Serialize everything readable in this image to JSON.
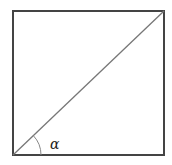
{
  "diagram": {
    "type": "square-with-diagonal",
    "angle_label": "α",
    "colors": {
      "square_stroke": "#444444",
      "diagonal_stroke": "#777777",
      "arc_stroke": "#888888",
      "background": "#ffffff"
    }
  }
}
